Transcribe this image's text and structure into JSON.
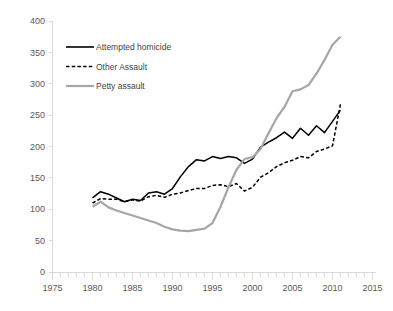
{
  "chart_data": {
    "type": "line",
    "title": "",
    "subtitle": "",
    "xlabel": "",
    "ylabel": "",
    "xlim": [
      1975,
      2015
    ],
    "ylim": [
      0,
      400
    ],
    "grid": false,
    "legend_position": "top-left",
    "x_ticks": [
      "1975",
      "1980",
      "1985",
      "1990",
      "1995",
      "2000",
      "2005",
      "2010",
      "2015"
    ],
    "y_ticks": [
      "0",
      "50",
      "100",
      "150",
      "200",
      "250",
      "300",
      "350",
      "400"
    ],
    "x_tick_step": 5,
    "x_minor_tick_step": 1,
    "y_tick_step": 50,
    "x": [
      1980,
      1981,
      1982,
      1983,
      1984,
      1985,
      1986,
      1987,
      1988,
      1989,
      1990,
      1991,
      1992,
      1993,
      1994,
      1995,
      1996,
      1997,
      1998,
      1999,
      2000,
      2001,
      2002,
      2003,
      2004,
      2005,
      2006,
      2007,
      2008,
      2009,
      2010,
      2011
    ],
    "series": [
      {
        "name": "Attempted homicide",
        "color": "#000000",
        "style": "solid",
        "values": [
          118,
          128,
          124,
          118,
          112,
          116,
          114,
          126,
          128,
          124,
          133,
          152,
          168,
          179,
          177,
          184,
          181,
          184,
          182,
          173,
          180,
          199,
          207,
          214,
          223,
          213,
          229,
          218,
          233,
          222,
          240,
          258
        ]
      },
      {
        "name": "Other Assault",
        "color": "#000000",
        "style": "dashed",
        "values": [
          110,
          117,
          116,
          116,
          112,
          115,
          113,
          120,
          122,
          119,
          124,
          126,
          130,
          133,
          133,
          138,
          139,
          136,
          141,
          129,
          135,
          151,
          158,
          168,
          174,
          178,
          184,
          182,
          192,
          196,
          201,
          268
        ]
      },
      {
        "name": "Petty assault",
        "color": "#a6a6a6",
        "style": "solid",
        "values": [
          104,
          112,
          103,
          98,
          94,
          90,
          86,
          82,
          78,
          72,
          68,
          66,
          65,
          67,
          69,
          78,
          104,
          135,
          163,
          180,
          183,
          196,
          221,
          245,
          263,
          288,
          291,
          298,
          316,
          338,
          362,
          375
        ]
      }
    ],
    "legend": [
      {
        "label": "Attempted homicide",
        "color": "#000000",
        "style": "solid"
      },
      {
        "label": "Other Assault",
        "color": "#000000",
        "style": "dashed"
      },
      {
        "label": "Petty assault",
        "color": "#a6a6a6",
        "style": "solid"
      }
    ]
  }
}
